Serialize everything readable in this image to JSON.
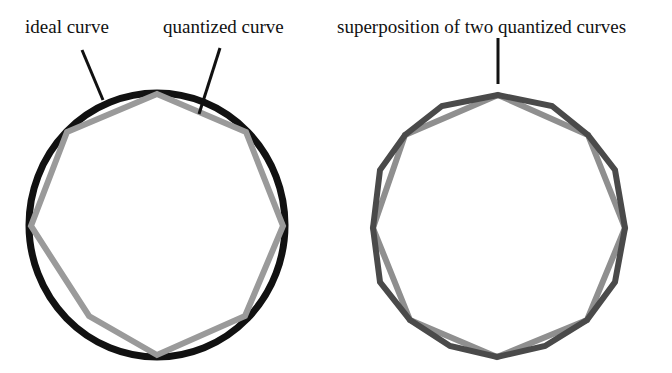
{
  "labels": {
    "ideal": "ideal curve",
    "quantized": "quantized curve",
    "superposition": "superposition of two quantized curves"
  },
  "colors": {
    "ideal": "#111111",
    "quantized": "#9a9a9a",
    "quantized_dark": "#4a4a4a"
  },
  "figures": [
    {
      "name": "left",
      "description": "ideal circle with quantized octagon"
    },
    {
      "name": "right",
      "description": "superposition of two quantized polygons"
    }
  ]
}
